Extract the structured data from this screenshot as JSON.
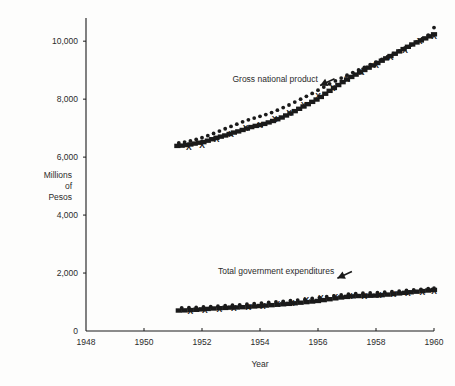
{
  "figure": {
    "background_color": "#ffffff",
    "ink_color": "#1a1a1a"
  },
  "chart_data": {
    "type": "scatter",
    "title": "",
    "subtitle": "",
    "xlabel": "Year",
    "ylabel": "Millions\nof\nPesos",
    "ylabel_lines": [
      "Millions",
      "of",
      "Pesos"
    ],
    "xlim": [
      1948,
      1960
    ],
    "ylim": [
      0,
      10800
    ],
    "xticks": [
      1948,
      1950,
      1952,
      1954,
      1956,
      1958,
      1960
    ],
    "xtick_labels": [
      "1948",
      "1950",
      "1952",
      "1954",
      "1956",
      "1958",
      "1960"
    ],
    "yticks": [
      0,
      2000,
      4000,
      6000,
      8000,
      10000
    ],
    "ytick_labels": [
      "0",
      "2,000",
      "4,000",
      "6,000",
      "8,000",
      "10,000"
    ],
    "grid": false,
    "legend": "none",
    "annotations": [
      {
        "text": "Gross national product",
        "x": 1953.05,
        "y": 8600,
        "arrow_to_x": 1954.55,
        "arrow_to_y": 7750,
        "marker": "arrow-down-right"
      },
      {
        "text": "Total government expenditures",
        "x": 1952.55,
        "y": 1950,
        "arrow_to_x": 1955.6,
        "arrow_to_y": 1330,
        "marker": "arrow-down-right"
      }
    ],
    "series": [
      {
        "name": "Gross national product (squares)",
        "marker": "square",
        "x": [
          1951.15,
          1951.3,
          1951.45,
          1951.6,
          1951.75,
          1951.9,
          1952.05,
          1952.2,
          1952.35,
          1952.5,
          1952.65,
          1952.8,
          1952.95,
          1953.1,
          1953.25,
          1953.4,
          1953.55,
          1953.7,
          1953.85,
          1954.0,
          1954.15,
          1954.3,
          1954.45,
          1954.6,
          1954.75,
          1954.9,
          1955.05,
          1955.2,
          1955.35,
          1955.5,
          1955.65,
          1955.8,
          1955.95,
          1956.1,
          1956.25,
          1956.4,
          1956.55,
          1956.7,
          1956.85,
          1957.0,
          1957.15,
          1957.3,
          1957.45,
          1957.6,
          1957.75,
          1957.9,
          1958.05,
          1958.2,
          1958.35,
          1958.5,
          1958.65,
          1958.8,
          1958.95,
          1959.1,
          1959.25,
          1959.4,
          1959.55,
          1959.7,
          1959.85,
          1960.0
        ],
        "y": [
          6380,
          6390,
          6410,
          6430,
          6460,
          6490,
          6510,
          6560,
          6610,
          6660,
          6700,
          6740,
          6790,
          6840,
          6880,
          6930,
          6980,
          7030,
          7070,
          7100,
          7140,
          7190,
          7240,
          7300,
          7360,
          7430,
          7500,
          7580,
          7660,
          7740,
          7820,
          7900,
          7980,
          8070,
          8180,
          8280,
          8380,
          8480,
          8580,
          8670,
          8760,
          8840,
          8920,
          9000,
          9080,
          9160,
          9240,
          9320,
          9400,
          9480,
          9560,
          9640,
          9720,
          9800,
          9880,
          9950,
          10020,
          10090,
          10160,
          10230
        ]
      },
      {
        "name": "Gross national product (dots)",
        "marker": "dot",
        "x": [
          1951.2,
          1951.4,
          1951.6,
          1951.8,
          1952.0,
          1952.2,
          1952.4,
          1952.6,
          1952.8,
          1953.0,
          1953.2,
          1953.4,
          1953.6,
          1953.8,
          1954.0,
          1954.2,
          1954.4,
          1954.6,
          1954.8,
          1955.0,
          1955.2,
          1955.4,
          1955.6,
          1955.8,
          1956.0,
          1956.2,
          1956.4,
          1956.6,
          1956.8,
          1957.0,
          1957.2,
          1957.4,
          1957.6,
          1957.8,
          1958.0,
          1958.2,
          1958.4,
          1958.6,
          1958.8,
          1959.0,
          1959.2,
          1959.4,
          1959.6,
          1959.8,
          1960.0
        ],
        "y": [
          6350,
          6380,
          6420,
          6470,
          6530,
          6600,
          6680,
          6760,
          6840,
          6920,
          7000,
          7080,
          7150,
          7210,
          7270,
          7330,
          7400,
          7480,
          7570,
          7660,
          7760,
          7860,
          7960,
          8060,
          8170,
          8280,
          8390,
          8490,
          8590,
          8690,
          8780,
          8870,
          8960,
          9050,
          9140,
          9230,
          9330,
          9430,
          9530,
          9630,
          9730,
          9840,
          9950,
          10070,
          10330
        ]
      },
      {
        "name": "Gross national product (X marks)",
        "marker": "x",
        "x": [
          1951.55,
          1952.0,
          1952.5,
          1953.0,
          1953.5,
          1954.0,
          1954.5,
          1955.0,
          1955.5,
          1956.0,
          1956.5,
          1957.0,
          1957.5,
          1958.0,
          1958.5,
          1959.0,
          1959.5,
          1960.0
        ],
        "y": [
          6340,
          6420,
          6620,
          6820,
          7000,
          7120,
          7310,
          7520,
          7800,
          8100,
          8400,
          8700,
          8930,
          9180,
          9450,
          9720,
          10000,
          10170
        ]
      },
      {
        "name": "Total government expenditures (squares)",
        "marker": "square",
        "x": [
          1951.2,
          1951.4,
          1951.6,
          1951.8,
          1952.0,
          1952.2,
          1952.4,
          1952.6,
          1952.8,
          1953.0,
          1953.2,
          1953.4,
          1953.6,
          1953.8,
          1954.0,
          1954.2,
          1954.4,
          1954.6,
          1954.8,
          1955.0,
          1955.2,
          1955.4,
          1955.6,
          1955.8,
          1956.0,
          1956.2,
          1956.4,
          1956.6,
          1956.8,
          1957.0,
          1957.2,
          1957.4,
          1957.6,
          1957.8,
          1958.0,
          1958.2,
          1958.4,
          1958.6,
          1958.8,
          1959.0,
          1959.2,
          1959.4,
          1959.6,
          1959.8,
          1960.0
        ],
        "y": [
          700,
          705,
          715,
          725,
          740,
          755,
          770,
          780,
          790,
          800,
          805,
          815,
          825,
          840,
          855,
          870,
          885,
          900,
          915,
          930,
          950,
          970,
          990,
          1010,
          1030,
          1060,
          1090,
          1120,
          1150,
          1170,
          1190,
          1200,
          1205,
          1210,
          1215,
          1230,
          1250,
          1270,
          1290,
          1310,
          1330,
          1350,
          1370,
          1390,
          1410
        ]
      },
      {
        "name": "Total government expenditures (dots)",
        "marker": "dot",
        "x": [
          1951.3,
          1951.55,
          1951.8,
          1952.05,
          1952.3,
          1952.55,
          1952.8,
          1953.05,
          1953.3,
          1953.55,
          1953.8,
          1954.05,
          1954.3,
          1954.55,
          1954.8,
          1955.05,
          1955.3,
          1955.55,
          1955.8,
          1956.05,
          1956.3,
          1956.55,
          1956.8,
          1957.05,
          1957.3,
          1957.55,
          1957.8,
          1958.05,
          1958.3,
          1958.55,
          1958.8,
          1959.05,
          1959.3,
          1959.55,
          1959.8,
          1960.0
        ],
        "y": [
          660,
          665,
          675,
          690,
          705,
          720,
          735,
          750,
          765,
          785,
          805,
          825,
          845,
          865,
          885,
          905,
          930,
          955,
          985,
          1015,
          1045,
          1075,
          1105,
          1130,
          1150,
          1165,
          1175,
          1185,
          1200,
          1220,
          1240,
          1260,
          1280,
          1300,
          1320,
          1340
        ]
      },
      {
        "name": "Total government expenditures (X marks)",
        "marker": "x",
        "x": [
          1951.6,
          1952.1,
          1952.6,
          1953.1,
          1953.6,
          1954.1,
          1954.6,
          1955.1,
          1955.6,
          1956.1,
          1956.6,
          1957.1,
          1957.6,
          1958.1,
          1958.6,
          1959.1,
          1959.6,
          1960.0
        ],
        "y": [
          690,
          730,
          760,
          800,
          840,
          880,
          930,
          990,
          1060,
          1130,
          1180,
          1200,
          1215,
          1240,
          1280,
          1320,
          1360,
          1400
        ]
      }
    ]
  }
}
